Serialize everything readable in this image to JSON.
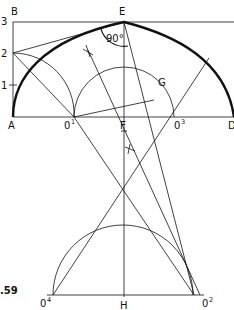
{
  "diagram": {
    "figure_label": ".59",
    "angle_label": "90°",
    "points": {
      "A": "A",
      "B": "B",
      "D": "D",
      "E": "E",
      "F": "F",
      "G": "G",
      "H": "H",
      "O1_base": "0",
      "O1_sup": "1",
      "O2_base": "0",
      "O2_sup": "2",
      "O3_base": "0",
      "O3_sup": "3",
      "O4_base": "0",
      "O4_sup": "4"
    },
    "scale": [
      "1",
      "2",
      "3"
    ],
    "colors": {
      "stroke": "#111111",
      "background": "#ffffff"
    }
  }
}
